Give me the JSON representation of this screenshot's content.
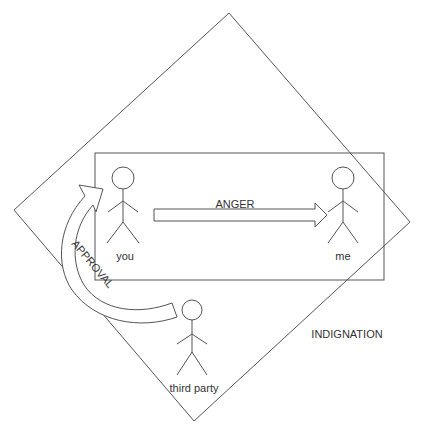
{
  "diagram": {
    "type": "concept-diagram",
    "colors": {
      "line": "#555555",
      "text": "#333333",
      "background": "#ffffff"
    },
    "regions": [
      {
        "id": "indignation",
        "shape": "rotated-square",
        "label": "INDIGNATION"
      },
      {
        "id": "anger-box",
        "shape": "rectangle",
        "label": ""
      }
    ],
    "actors": [
      {
        "id": "you",
        "label": "you"
      },
      {
        "id": "me",
        "label": "me"
      },
      {
        "id": "third-party",
        "label": "third party"
      }
    ],
    "arrows": [
      {
        "id": "anger-arrow",
        "from": "you",
        "to": "me",
        "label": "ANGER",
        "style": "block-straight"
      },
      {
        "id": "approval-arrow",
        "from": "third party",
        "to": "you",
        "label": "APPROVAL",
        "style": "block-curved"
      }
    ]
  }
}
